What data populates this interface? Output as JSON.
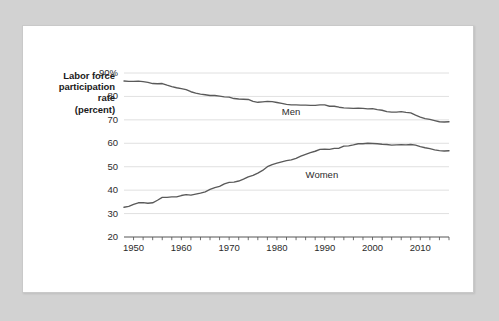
{
  "chart_data": {
    "type": "line",
    "title": "",
    "subtitle": "",
    "ylabel_lines": [
      "Labor force",
      "participation",
      "rate",
      "(percent)"
    ],
    "ylabel": "Labor force participation rate (percent)",
    "xlabel": "",
    "ylim": [
      20,
      90
    ],
    "xlim": [
      1948,
      2016
    ],
    "yticks": [
      20,
      30,
      40,
      50,
      60,
      70,
      80,
      90
    ],
    "ytick_labels": [
      "20",
      "30",
      "40",
      "50",
      "60",
      "70",
      "80",
      "90%"
    ],
    "xticks": [
      1950,
      1960,
      1970,
      1980,
      1990,
      2000,
      2010
    ],
    "xtick_labels": [
      "1950",
      "1960",
      "1970",
      "1980",
      "1990",
      "2000",
      "2010"
    ],
    "minor_xtick_interval": 2,
    "grid": "horizontal",
    "grid_color": "#d8d8d8",
    "line_color": "#5a5a5a",
    "axis_color": "#555555",
    "legend_position": "inline-annotation",
    "annotations": [
      {
        "text": "Men",
        "x": 1981,
        "y": 73.6
      },
      {
        "text": "Women",
        "x": 1986,
        "y": 47.0
      }
    ],
    "series": [
      {
        "name": "Men",
        "label": "Men",
        "x": [
          1948,
          1949,
          1950,
          1951,
          1952,
          1953,
          1954,
          1955,
          1956,
          1957,
          1958,
          1959,
          1960,
          1961,
          1962,
          1963,
          1964,
          1965,
          1966,
          1967,
          1968,
          1969,
          1970,
          1971,
          1972,
          1973,
          1974,
          1975,
          1976,
          1977,
          1978,
          1979,
          1980,
          1981,
          1982,
          1983,
          1984,
          1985,
          1986,
          1987,
          1988,
          1989,
          1990,
          1991,
          1992,
          1993,
          1994,
          1995,
          1996,
          1997,
          1998,
          1999,
          2000,
          2001,
          2002,
          2003,
          2004,
          2005,
          2006,
          2007,
          2008,
          2009,
          2010,
          2011,
          2012,
          2013,
          2014,
          2015,
          2016
        ],
        "values": [
          86.6,
          86.4,
          86.4,
          86.5,
          86.3,
          86.0,
          85.5,
          85.4,
          85.5,
          84.8,
          84.2,
          83.7,
          83.3,
          82.9,
          82.0,
          81.4,
          81.0,
          80.7,
          80.4,
          80.4,
          80.1,
          79.8,
          79.7,
          79.1,
          78.9,
          78.8,
          78.7,
          77.9,
          77.5,
          77.7,
          77.9,
          77.8,
          77.4,
          77.0,
          76.6,
          76.4,
          76.4,
          76.3,
          76.3,
          76.2,
          76.2,
          76.4,
          76.4,
          75.8,
          75.8,
          75.4,
          75.1,
          75.0,
          74.9,
          75.0,
          74.9,
          74.7,
          74.8,
          74.4,
          74.1,
          73.5,
          73.3,
          73.3,
          73.5,
          73.2,
          73.0,
          72.0,
          71.2,
          70.5,
          70.2,
          69.7,
          69.2,
          69.1,
          69.2
        ]
      },
      {
        "name": "Women",
        "label": "Women",
        "x": [
          1948,
          1949,
          1950,
          1951,
          1952,
          1953,
          1954,
          1955,
          1956,
          1957,
          1958,
          1959,
          1960,
          1961,
          1962,
          1963,
          1964,
          1965,
          1966,
          1967,
          1968,
          1969,
          1970,
          1971,
          1972,
          1973,
          1974,
          1975,
          1976,
          1977,
          1978,
          1979,
          1980,
          1981,
          1982,
          1983,
          1984,
          1985,
          1986,
          1987,
          1988,
          1989,
          1990,
          1991,
          1992,
          1993,
          1994,
          1995,
          1996,
          1997,
          1998,
          1999,
          2000,
          2001,
          2002,
          2003,
          2004,
          2005,
          2006,
          2007,
          2008,
          2009,
          2010,
          2011,
          2012,
          2013,
          2014,
          2015,
          2016
        ],
        "values": [
          32.7,
          33.1,
          33.9,
          34.6,
          34.7,
          34.4,
          34.6,
          35.7,
          36.9,
          36.9,
          37.1,
          37.1,
          37.7,
          38.1,
          37.9,
          38.3,
          38.7,
          39.3,
          40.3,
          41.1,
          41.6,
          42.7,
          43.3,
          43.4,
          43.9,
          44.7,
          45.7,
          46.3,
          47.3,
          48.4,
          50.0,
          50.9,
          51.5,
          52.1,
          52.6,
          52.9,
          53.6,
          54.5,
          55.3,
          56.0,
          56.6,
          57.4,
          57.5,
          57.4,
          57.8,
          57.9,
          58.8,
          58.9,
          59.3,
          59.8,
          59.8,
          60.0,
          59.9,
          59.8,
          59.6,
          59.5,
          59.2,
          59.3,
          59.4,
          59.3,
          59.5,
          59.2,
          58.6,
          58.1,
          57.7,
          57.2,
          56.9,
          56.7,
          56.8
        ]
      }
    ]
  }
}
